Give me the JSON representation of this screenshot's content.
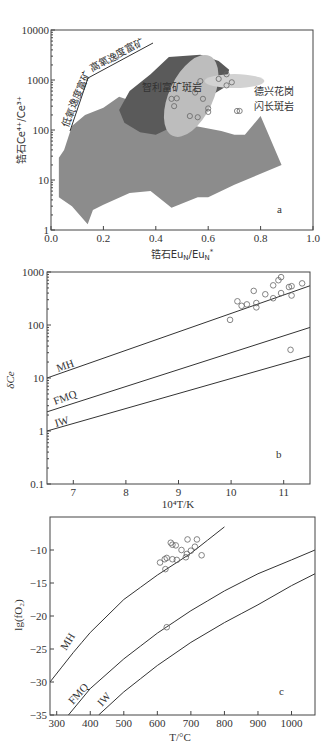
{
  "chart_data": [
    {
      "panel": "a",
      "type": "scatter",
      "xlabel": "锆石Eu_N/Eu_N*",
      "ylabel": "锆石Ce4+/Ce3+",
      "xlim": [
        0.0,
        1.0
      ],
      "ylim": [
        1,
        10000
      ],
      "yscale": "log",
      "xticks": [
        "0.0",
        "0.2",
        "0.4",
        "0.6",
        "0.8",
        "1.0"
      ],
      "yticks": [
        "1",
        "10",
        "100",
        "1000",
        "10000"
      ],
      "panel_label": "a",
      "annotations": [
        "低氧逸度富矿",
        "高氧逸度富矿",
        "智利富矿斑岩",
        "德兴花岗",
        "闪长斑岩"
      ],
      "fields": [
        {
          "name": "barren field",
          "color": "#8c8c8c"
        },
        {
          "name": "Chile fertile porphyry (dark)",
          "color": "#5a5a5a"
        },
        {
          "name": "Chile ellipse",
          "color": "#bdbdbd"
        },
        {
          "name": "Dexing ellipse",
          "color": "#d2d2d2"
        }
      ],
      "points": [
        {
          "x": 0.46,
          "y": 420
        },
        {
          "x": 0.48,
          "y": 430
        },
        {
          "x": 0.47,
          "y": 300
        },
        {
          "x": 0.55,
          "y": 560
        },
        {
          "x": 0.57,
          "y": 950
        },
        {
          "x": 0.58,
          "y": 420
        },
        {
          "x": 0.6,
          "y": 270
        },
        {
          "x": 0.6,
          "y": 230
        },
        {
          "x": 0.56,
          "y": 180
        },
        {
          "x": 0.53,
          "y": 190
        },
        {
          "x": 0.64,
          "y": 1050
        },
        {
          "x": 0.67,
          "y": 1300
        },
        {
          "x": 0.69,
          "y": 900
        },
        {
          "x": 0.67,
          "y": 780
        },
        {
          "x": 0.71,
          "y": 240
        },
        {
          "x": 0.72,
          "y": 240
        }
      ]
    },
    {
      "panel": "b",
      "type": "scatter",
      "xlabel": "10^4 T/K",
      "ylabel": "δCe",
      "xlim": [
        6.5,
        11.5
      ],
      "ylim": [
        0.1,
        1000
      ],
      "yscale": "log",
      "xticks": [
        "7",
        "8",
        "9",
        "10",
        "11"
      ],
      "yticks": [
        "0.1",
        "1",
        "10",
        "100",
        "1000"
      ],
      "panel_label": "b",
      "series": [
        {
          "name": "MH",
          "x": [
            6.5,
            11.5
          ],
          "y": [
            10,
            550
          ]
        },
        {
          "name": "FMQ",
          "x": [
            6.5,
            11.5
          ],
          "y": [
            2.3,
            90
          ]
        },
        {
          "name": "IW",
          "x": [
            6.5,
            11.5
          ],
          "y": [
            1.0,
            26
          ]
        }
      ],
      "points": [
        {
          "x": 9.98,
          "y": 125
        },
        {
          "x": 10.12,
          "y": 280
        },
        {
          "x": 10.2,
          "y": 230
        },
        {
          "x": 10.3,
          "y": 245
        },
        {
          "x": 10.43,
          "y": 440
        },
        {
          "x": 10.48,
          "y": 260
        },
        {
          "x": 10.48,
          "y": 215
        },
        {
          "x": 10.65,
          "y": 380
        },
        {
          "x": 10.8,
          "y": 560
        },
        {
          "x": 10.8,
          "y": 320
        },
        {
          "x": 10.9,
          "y": 700
        },
        {
          "x": 10.95,
          "y": 800
        },
        {
          "x": 10.95,
          "y": 400
        },
        {
          "x": 11.1,
          "y": 520
        },
        {
          "x": 11.15,
          "y": 540
        },
        {
          "x": 11.15,
          "y": 360
        },
        {
          "x": 11.35,
          "y": 610
        },
        {
          "x": 11.13,
          "y": 34
        }
      ]
    },
    {
      "panel": "c",
      "type": "scatter",
      "xlabel": "T/°C",
      "ylabel": "lg(f_O2)",
      "xlim": [
        280,
        1070
      ],
      "ylim": [
        -35,
        -5
      ],
      "xticks": [
        "300",
        "400",
        "500",
        "600",
        "700",
        "800",
        "900",
        "1000"
      ],
      "yticks": [
        "-10",
        "-15",
        "-20",
        "-25",
        "-30",
        "-35"
      ],
      "panel_label": "c",
      "series": [
        {
          "name": "MH",
          "x": [
            280,
            350,
            400,
            500,
            600,
            700,
            800
          ],
          "y": [
            -30,
            -25.5,
            -22.5,
            -17.5,
            -13.8,
            -10.5,
            -6.5
          ]
        },
        {
          "name": "FMQ",
          "x": [
            335,
            400,
            500,
            600,
            700,
            800,
            900,
            1000,
            1070
          ],
          "y": [
            -35,
            -31,
            -26.5,
            -22.6,
            -19.2,
            -16.2,
            -13.6,
            -11.5,
            -10
          ]
        },
        {
          "name": "IW",
          "x": [
            425,
            500,
            600,
            700,
            800,
            900,
            1000,
            1070
          ],
          "y": [
            -35,
            -31.5,
            -27.5,
            -24.0,
            -21.0,
            -18.3,
            -15.4,
            -13.6
          ]
        }
      ],
      "points": [
        {
          "x": 608,
          "y": -11.9
        },
        {
          "x": 622,
          "y": -11.4
        },
        {
          "x": 628,
          "y": -11.2
        },
        {
          "x": 624,
          "y": -12.9
        },
        {
          "x": 640,
          "y": -8.9
        },
        {
          "x": 645,
          "y": -9.2
        },
        {
          "x": 645,
          "y": -11.4
        },
        {
          "x": 655,
          "y": -9.3
        },
        {
          "x": 658,
          "y": -11.5
        },
        {
          "x": 672,
          "y": -10.0
        },
        {
          "x": 685,
          "y": -11.1
        },
        {
          "x": 688,
          "y": -10.6
        },
        {
          "x": 690,
          "y": -8.4
        },
        {
          "x": 700,
          "y": -10.1
        },
        {
          "x": 712,
          "y": -9.5
        },
        {
          "x": 718,
          "y": -8.4
        },
        {
          "x": 732,
          "y": -10.8
        },
        {
          "x": 628,
          "y": -21.7
        }
      ]
    }
  ],
  "labels": {
    "a": {
      "xlabel": "锆石Eu",
      "xlabel_sub": "N",
      "xlabel_mid": "/Eu",
      "xlabel_sub2": "N",
      "xlabel_sup": "*",
      "ylabel": "锆石Ce⁴⁺/Ce³⁺",
      "low": "低氧逸度富矿",
      "high": "高氧逸度富矿",
      "chile": "智利富矿斑岩",
      "dexing1": "德兴花岗",
      "dexing2": "闪长斑岩",
      "panel": "a"
    },
    "b": {
      "xlabel": "10⁴T/K",
      "ylabel": "δCe",
      "mh": "MH",
      "fmq": "FMQ",
      "iw": "IW",
      "panel": "b"
    },
    "c": {
      "xlabel": "T/°C",
      "ylabel": "lg(fO₂)",
      "mh": "MH",
      "fmq": "FMQ",
      "iw": "IW",
      "panel": "c"
    }
  }
}
